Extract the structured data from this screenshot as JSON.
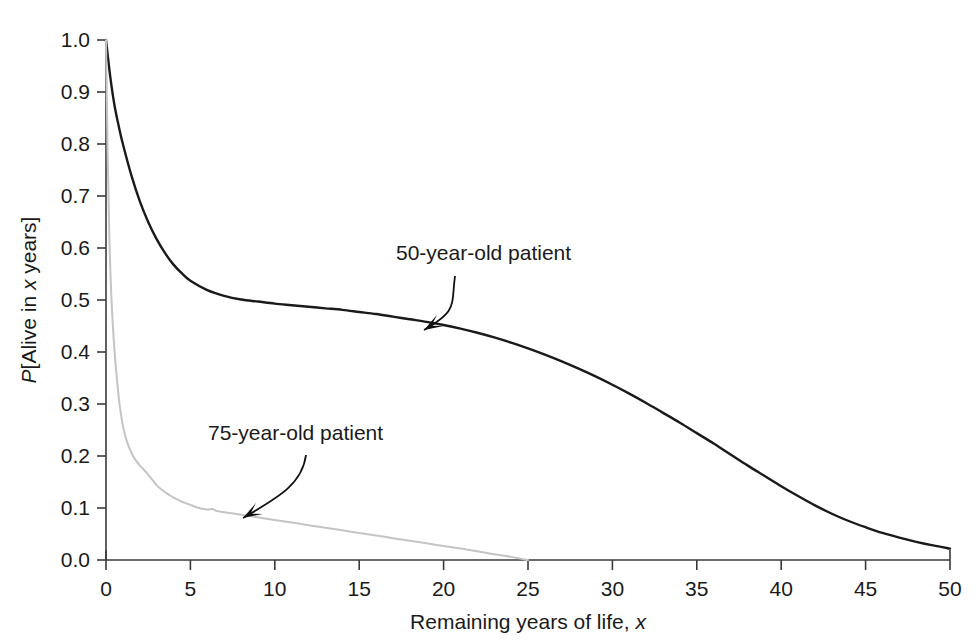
{
  "chart_data": {
    "type": "line",
    "title": "",
    "xlabel": "Remaining years of life, x",
    "xlabel_plain": "Remaining years of life,",
    "xlabel_italic": "x",
    "ylabel": "P[Alive in x years]",
    "ylabel_parts": {
      "p": "P",
      "bracket_open": "[Alive in ",
      "x": "x",
      "tail": " years]"
    },
    "xlim": [
      0,
      50
    ],
    "ylim": [
      0.0,
      1.0
    ],
    "xticks": [
      0,
      5,
      10,
      15,
      20,
      25,
      30,
      35,
      40,
      45,
      50
    ],
    "xtick_labels": [
      "0",
      "5",
      "10",
      "15",
      "20",
      "25",
      "30",
      "35",
      "40",
      "45",
      "50"
    ],
    "yticks": [
      0.0,
      0.1,
      0.2,
      0.3,
      0.4,
      0.5,
      0.6,
      0.7,
      0.8,
      0.9,
      1.0
    ],
    "ytick_labels": [
      "0.0",
      "0.1",
      "0.2",
      "0.3",
      "0.4",
      "0.5",
      "0.6",
      "0.7",
      "0.8",
      "0.9",
      "1.0"
    ],
    "grid": false,
    "legend_position": "inline-annotations",
    "series": [
      {
        "name": "50-year-old patient",
        "color": "#1a1a1a",
        "linewidth": 2.4,
        "x": [
          0,
          0.25,
          0.5,
          0.75,
          1,
          1.5,
          2,
          2.5,
          3,
          3.5,
          4,
          4.5,
          5,
          6,
          7,
          8,
          9,
          10,
          11,
          12,
          13,
          14,
          15,
          16,
          17,
          18,
          19,
          20,
          21,
          22,
          23,
          24,
          25,
          26,
          27,
          28,
          29,
          30,
          31,
          32,
          33,
          34,
          35,
          36,
          37,
          38,
          39,
          40,
          41,
          42,
          43,
          44,
          45,
          46,
          47,
          48,
          49,
          50
        ],
        "y": [
          1.0,
          0.93,
          0.875,
          0.835,
          0.8,
          0.74,
          0.69,
          0.65,
          0.617,
          0.59,
          0.568,
          0.551,
          0.537,
          0.519,
          0.508,
          0.501,
          0.497,
          0.493,
          0.49,
          0.487,
          0.484,
          0.481,
          0.477,
          0.473,
          0.468,
          0.463,
          0.458,
          0.452,
          0.445,
          0.437,
          0.428,
          0.418,
          0.407,
          0.395,
          0.382,
          0.368,
          0.353,
          0.337,
          0.32,
          0.302,
          0.283,
          0.264,
          0.244,
          0.224,
          0.203,
          0.182,
          0.162,
          0.142,
          0.123,
          0.105,
          0.089,
          0.075,
          0.063,
          0.052,
          0.043,
          0.035,
          0.028,
          0.022
        ]
      },
      {
        "name": "75-year-old patient",
        "color": "#c4c4c4",
        "linewidth": 2.0,
        "x": [
          0,
          0.1,
          0.2,
          0.3,
          0.4,
          0.5,
          0.6,
          0.7,
          0.8,
          0.9,
          1.0,
          1.2,
          1.4,
          1.6,
          1.8,
          2.0,
          2.2,
          2.4,
          2.6,
          2.8,
          3.0,
          3.2,
          3.4,
          3.6,
          3.8,
          4.0,
          4.25,
          4.5,
          4.75,
          5.0,
          5.5,
          6.0,
          6.3,
          6.6,
          7.0,
          8.0,
          9.0,
          10.0,
          11.0,
          12.0,
          13.0,
          14.0,
          15.0,
          16.0,
          17.0,
          18.0,
          19.0,
          20.0,
          21.0,
          22.0,
          23.0,
          24.0,
          25.0
        ],
        "y": [
          1.0,
          0.78,
          0.62,
          0.52,
          0.455,
          0.405,
          0.365,
          0.33,
          0.3,
          0.278,
          0.258,
          0.232,
          0.214,
          0.2,
          0.19,
          0.182,
          0.175,
          0.168,
          0.16,
          0.152,
          0.144,
          0.138,
          0.133,
          0.128,
          0.124,
          0.12,
          0.116,
          0.112,
          0.109,
          0.106,
          0.1,
          0.097,
          0.098,
          0.094,
          0.092,
          0.087,
          0.082,
          0.077,
          0.072,
          0.067,
          0.062,
          0.057,
          0.052,
          0.047,
          0.042,
          0.037,
          0.032,
          0.027,
          0.022,
          0.017,
          0.011,
          0.006,
          0.0
        ]
      }
    ],
    "annotations": [
      {
        "id": "annot-50",
        "text": "50-year-old patient",
        "label_x": 396,
        "label_y": 260,
        "arrow_from": [
          455,
          276
        ],
        "arrow_to": [
          424,
          330
        ]
      },
      {
        "id": "annot-75",
        "text": "75-year-old patient",
        "label_x": 208,
        "label_y": 440,
        "arrow_from": [
          306,
          455
        ],
        "arrow_to": [
          243,
          518
        ]
      }
    ]
  }
}
